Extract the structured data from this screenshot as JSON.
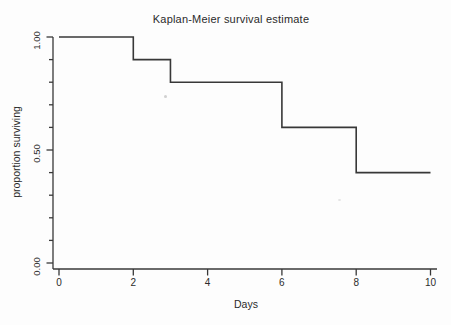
{
  "figure": {
    "background": "#fdfdfd",
    "line_color": "#383838",
    "text_color": "#2b2b2b"
  },
  "chart_data": {
    "type": "line",
    "step_style": "post",
    "title": "Kaplan-Meier survival estimate",
    "xlabel": "Days",
    "ylabel": "proportion surviving",
    "xlim": [
      0,
      10
    ],
    "ylim": [
      0,
      1
    ],
    "x_ticks": [
      0,
      2,
      4,
      6,
      8,
      10
    ],
    "y_major_ticks": [
      {
        "value": 0.0,
        "label": "0.00"
      },
      {
        "value": 0.5,
        "label": "0.50"
      },
      {
        "value": 1.0,
        "label": "1.00"
      }
    ],
    "y_minor_ticks": [
      0.1,
      0.2,
      0.3,
      0.4,
      0.6,
      0.7,
      0.8,
      0.9
    ],
    "grid": false,
    "legend": false,
    "series": [
      {
        "name": "Kaplan-Meier survival estimate",
        "steps": [
          {
            "time": 0,
            "survival": 1.0
          },
          {
            "time": 2,
            "survival": 0.9
          },
          {
            "time": 3,
            "survival": 0.8
          },
          {
            "time": 6,
            "survival": 0.6
          },
          {
            "time": 8,
            "survival": 0.4
          }
        ],
        "end_time": 10
      }
    ]
  }
}
